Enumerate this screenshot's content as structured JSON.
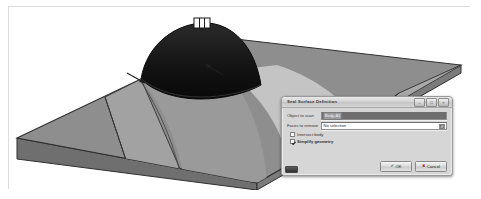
{
  "viewport": {
    "name": "cad-3d-viewport",
    "description": "3D CAD model view of a slab with a dome-shaped protrusion",
    "background": "#ffffff",
    "model": {
      "slab_top_color": "#8e8e8e",
      "slab_front_color": "#8a8a8a",
      "slab_edge_color": "#3a3a3a",
      "dome_color": "#1a1a1a",
      "highlight_light": "#c9c9c9",
      "highlight_mid": "#a5a5a5",
      "handle_color": "#ffffff"
    }
  },
  "dialog": {
    "title": "Seal Surface Definition",
    "window_controls": [
      {
        "name": "minimize",
        "glyph": "–"
      },
      {
        "name": "maximize",
        "glyph": "□"
      },
      {
        "name": "close",
        "glyph": "×"
      }
    ],
    "fields": [
      {
        "label": "Object to scan",
        "value": "Body-A1",
        "state": "selected"
      },
      {
        "label": "Faces to remove",
        "value": "No selection",
        "placeholder": "No selection",
        "picker_icon": "face-picker-icon"
      }
    ],
    "checkboxes": [
      {
        "label": "Intersect body",
        "checked": false
      },
      {
        "label": "Simplify geometry",
        "checked": true
      }
    ],
    "buttons": [
      {
        "label": "OK",
        "glyph": "✔",
        "role": "confirm"
      },
      {
        "label": "Cancel",
        "glyph": "✖",
        "role": "dismiss"
      }
    ]
  }
}
